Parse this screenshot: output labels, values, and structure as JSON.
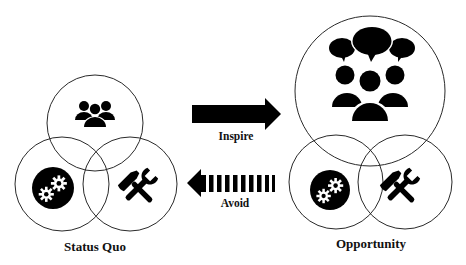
{
  "diagram": {
    "left_group": {
      "label": "Status Quo",
      "circles": [
        {
          "role": "people",
          "icon": "group-icon"
        },
        {
          "role": "process",
          "icon": "gears-icon"
        },
        {
          "role": "tools",
          "icon": "tools-icon"
        }
      ]
    },
    "right_group": {
      "label": "Opportunity",
      "circles": [
        {
          "role": "people",
          "icon": "group-discussion-icon",
          "emphasis": "enlarged"
        },
        {
          "role": "process",
          "icon": "gears-icon"
        },
        {
          "role": "tools",
          "icon": "tools-icon"
        }
      ]
    },
    "arrows": [
      {
        "label": "Inspire",
        "direction": "right",
        "style": "solid",
        "from": "Status Quo",
        "to": "Opportunity"
      },
      {
        "label": "Avoid",
        "direction": "left",
        "style": "dashed",
        "from": "Opportunity",
        "to": "Status Quo"
      }
    ],
    "colors": {
      "ink": "#000000",
      "outline": "#2a2a2a",
      "background": "#ffffff"
    }
  }
}
